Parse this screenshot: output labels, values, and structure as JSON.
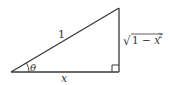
{
  "diagram": {
    "type": "right-triangle",
    "vertices": {
      "left": [
        11,
        72
      ],
      "right_angle": [
        119,
        72
      ],
      "top": [
        119,
        8
      ]
    },
    "labels": {
      "hypotenuse": "1",
      "base": "x",
      "angle": "θ",
      "vertical_side_radical": "√",
      "vertical_side_expr": "1 − x",
      "vertical_side_exponent": "2"
    },
    "colors": {
      "stroke": "#3a3a3a",
      "text": "#333333",
      "background": "#ffffff"
    }
  }
}
